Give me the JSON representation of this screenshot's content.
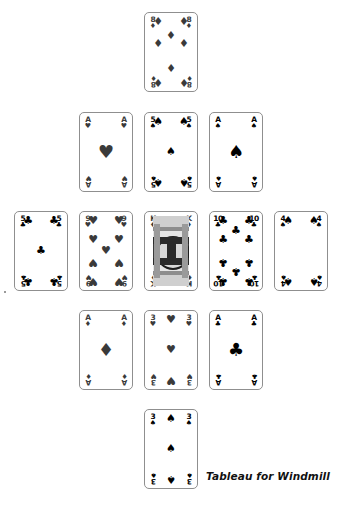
{
  "caption": "Tableau for Windmill",
  "game": "Windmill",
  "layout": {
    "shape": "cross",
    "card_width": 54,
    "card_height": 80,
    "columns_x": [
      14,
      79,
      144,
      209,
      274
    ],
    "rows_y": [
      12,
      112,
      211,
      310,
      409
    ]
  },
  "suit_glyphs": {
    "spades": "♠",
    "hearts": "♥",
    "diamonds": "♦",
    "clubs": "♣"
  },
  "cards": [
    {
      "id": "card-top",
      "rank": "8",
      "suit": "diamonds",
      "suit_symbol": "♦",
      "label": "8 of Diamonds",
      "color": "red",
      "x": 144,
      "y": 12,
      "position": "top-arm",
      "face": "pip"
    },
    {
      "id": "card-upper-left",
      "rank": "A",
      "suit": "hearts",
      "suit_symbol": "♥",
      "label": "Ace of Hearts",
      "color": "red",
      "x": 79,
      "y": 112,
      "position": "upper-left",
      "face": "pip"
    },
    {
      "id": "card-upper-center",
      "rank": "5",
      "suit": "spades",
      "suit_symbol": "♠",
      "label": "5 of Spades",
      "color": "black",
      "x": 144,
      "y": 112,
      "position": "upper-center",
      "face": "pip"
    },
    {
      "id": "card-upper-right",
      "rank": "A",
      "suit": "spades",
      "suit_symbol": "♠",
      "label": "Ace of Spades",
      "color": "black",
      "x": 209,
      "y": 112,
      "position": "upper-right",
      "face": "pip"
    },
    {
      "id": "card-left-outer",
      "rank": "5",
      "suit": "clubs",
      "suit_symbol": "♣",
      "label": "5 of Clubs",
      "color": "black",
      "x": 14,
      "y": 211,
      "position": "left-outer",
      "face": "pip"
    },
    {
      "id": "card-left-inner",
      "rank": "9",
      "suit": "hearts",
      "suit_symbol": "♥",
      "label": "9 of Hearts",
      "color": "red",
      "x": 79,
      "y": 211,
      "position": "left-inner",
      "face": "pip"
    },
    {
      "id": "card-center",
      "rank": "K",
      "suit": "diamonds",
      "suit_symbol": "♦",
      "label": "King of Diamonds",
      "color": "red",
      "x": 144,
      "y": 211,
      "position": "center",
      "face": "court"
    },
    {
      "id": "card-right-inner",
      "rank": "10",
      "suit": "clubs",
      "suit_symbol": "♣",
      "label": "10 of Clubs",
      "color": "black",
      "x": 209,
      "y": 211,
      "position": "right-inner",
      "face": "pip"
    },
    {
      "id": "card-right-outer",
      "rank": "4",
      "suit": "spades",
      "suit_symbol": "♠",
      "label": "4 of Spades",
      "color": "black",
      "x": 274,
      "y": 211,
      "position": "right-outer",
      "face": "pip"
    },
    {
      "id": "card-lower-left",
      "rank": "A",
      "suit": "diamonds",
      "suit_symbol": "♦",
      "label": "Ace of Diamonds",
      "color": "red",
      "x": 79,
      "y": 310,
      "position": "lower-left",
      "face": "pip"
    },
    {
      "id": "card-lower-center",
      "rank": "3",
      "suit": "hearts",
      "suit_symbol": "♥",
      "label": "3 of Hearts",
      "color": "red",
      "x": 144,
      "y": 310,
      "position": "lower-center",
      "face": "pip"
    },
    {
      "id": "card-lower-right",
      "rank": "A",
      "suit": "clubs",
      "suit_symbol": "♣",
      "label": "Ace of Clubs",
      "color": "black",
      "x": 209,
      "y": 310,
      "position": "lower-right",
      "face": "pip"
    },
    {
      "id": "card-bottom",
      "rank": "3",
      "suit": "spades",
      "suit_symbol": "♠",
      "label": "3 of Spades",
      "color": "black",
      "x": 144,
      "y": 409,
      "position": "bottom-arm",
      "face": "pip"
    }
  ]
}
